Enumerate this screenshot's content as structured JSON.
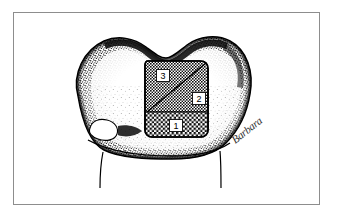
{
  "figure": {
    "frame": {
      "border_color": "#8d8d8d",
      "background_color": "#ffffff"
    },
    "ink_color": "#000000",
    "signature": {
      "text": "Barbara",
      "name": "artist-signature"
    },
    "tooth": {
      "name": "molar-occlusal-outline",
      "outline_color": "#000000",
      "stipple_color": "#000000",
      "fill_color": "#ffffff",
      "root_lines": 2
    },
    "cavity": {
      "name": "cavity-preparation",
      "outline_color": "#000000",
      "hatch_color": "#000000",
      "zones": [
        {
          "id": "zone-1",
          "label": "1",
          "position": "cervical-band",
          "texture": "coarse-checker"
        },
        {
          "id": "zone-2",
          "label": "2",
          "position": "lower-right-triangle",
          "texture": "fine-checker"
        },
        {
          "id": "zone-3",
          "label": "3",
          "position": "upper-left-triangle",
          "texture": "fine-checker"
        }
      ],
      "diagonal_divider": true
    }
  }
}
